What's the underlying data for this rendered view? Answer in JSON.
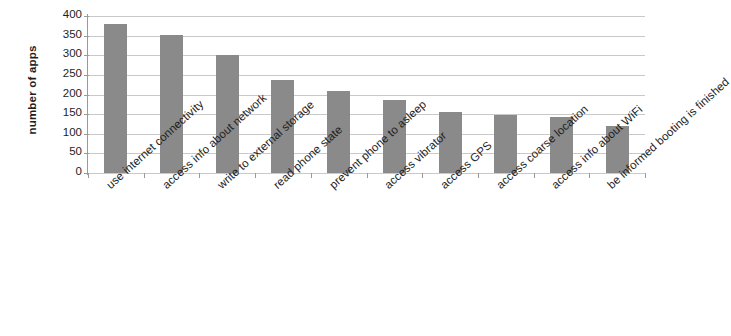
{
  "chart_data": {
    "type": "bar",
    "title": "",
    "xlabel": "",
    "ylabel": "number of apps",
    "ylim": [
      0,
      400
    ],
    "ytick_values": [
      0,
      50,
      100,
      150,
      200,
      250,
      300,
      350,
      400
    ],
    "ytick_labels": [
      "0",
      "50",
      "100",
      "150",
      "200",
      "250",
      "300",
      "350",
      "400"
    ],
    "grid": true,
    "legend": "none",
    "bar_color": "#8a8a8a",
    "gridline_color": "#c9c9c9",
    "axis_color": "#9a9a9a",
    "categories": [
      "use internet connectivity",
      "access info about network",
      "write to external storage",
      "read phone state",
      "prevent phone to asleep",
      "access vibrator",
      "access GPS",
      "access coarse location",
      "access info about WiFi",
      "be informed booting is finished"
    ],
    "values": [
      380,
      352,
      300,
      237,
      210,
      185,
      155,
      148,
      143,
      120
    ]
  }
}
